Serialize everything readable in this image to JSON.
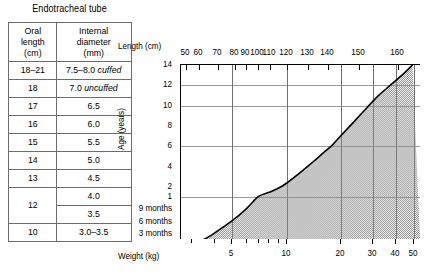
{
  "table": {
    "title": "Endotracheal tube",
    "headers": [
      "Oral\nlength\n(cm)",
      "Internal\ndiameter\n(mm)"
    ],
    "header_oral_l1": "Oral",
    "header_oral_l2": "length",
    "header_oral_l3": "(cm)",
    "header_diam_l1": "Internal",
    "header_diam_l2": "diameter",
    "header_diam_l3": "(mm)",
    "rows": [
      {
        "oral_length": "18–21",
        "diameter": "7.5–8.0 ",
        "diameter_note": "cuffed"
      },
      {
        "oral_length": "18",
        "diameter": "7.0 ",
        "diameter_note": "uncuffed"
      },
      {
        "oral_length": "17",
        "diameter": "6.5",
        "diameter_note": ""
      },
      {
        "oral_length": "16",
        "diameter": "6.0",
        "diameter_note": ""
      },
      {
        "oral_length": "15",
        "diameter": "5.5",
        "diameter_note": ""
      },
      {
        "oral_length": "14",
        "diameter": "5.0",
        "diameter_note": ""
      },
      {
        "oral_length": "13",
        "diameter": "4.5",
        "diameter_note": ""
      },
      {
        "oral_length": "12",
        "diameter": "4.0",
        "diameter_note": ""
      },
      {
        "oral_length": "",
        "diameter": "3.5",
        "diameter_note": ""
      },
      {
        "oral_length": "10",
        "diameter": "3.0–3.5",
        "diameter_note": ""
      }
    ]
  },
  "chart_data": {
    "type": "area",
    "title": "",
    "xlabel": "Weight (kg)",
    "ylabel": "Age (years)",
    "top_axis_label": "Length (cm)",
    "grid": true,
    "legend": null,
    "x_scale": "log",
    "xlim": [
      2.6,
      55
    ],
    "x_ticks_major": [
      5,
      10,
      20,
      30,
      40,
      50
    ],
    "x_ticks_major_labels": [
      "5",
      "10",
      "20",
      "30",
      "40",
      "50"
    ],
    "x_ticks_minor": [
      3,
      4,
      6,
      7,
      8,
      9
    ],
    "top_ticks_values": [
      50,
      60,
      70,
      80,
      90,
      100,
      110,
      120,
      130,
      140,
      150,
      160
    ],
    "top_ticks_labels": [
      "50",
      "60",
      "70",
      "80",
      "90",
      "100",
      "110",
      "120",
      "130",
      "140",
      "150",
      "160"
    ],
    "y_ticks_labels": [
      "14",
      "12",
      "10",
      "8",
      "6",
      "4",
      "2",
      "1",
      "9 months",
      "6 months",
      "3 months"
    ],
    "y_ticks_values": [
      14,
      12,
      10,
      8,
      6,
      4,
      2,
      1,
      0.75,
      0.5,
      0.25
    ],
    "y_gridline_labels": [
      "12",
      "10",
      "6",
      "1"
    ],
    "series": [
      {
        "name": "Age vs weight growth curve",
        "x": [
          3.0,
          3.5,
          4.0,
          5.0,
          6.0,
          7.0,
          8.0,
          9.0,
          10.0,
          12.0,
          14.0,
          16.0,
          18.0,
          20.0,
          24.0,
          28.0,
          32.0,
          36.0,
          40.0,
          45.0,
          50.0
        ],
        "y": [
          0.02,
          0.12,
          0.25,
          0.5,
          0.75,
          1.0,
          1.4,
          1.8,
          2.3,
          3.4,
          4.4,
          5.3,
          6.1,
          7.0,
          8.5,
          9.8,
          10.9,
          11.7,
          12.4,
          13.2,
          14.0
        ]
      }
    ],
    "fill": "stipple-grey",
    "fill_color": "#8a8a8a"
  },
  "colors": {
    "border": "#6d6d6d",
    "axis": "#000000",
    "gridline": "#9a9a9a",
    "fill": "#8a8a8a",
    "background": "#ffffff"
  }
}
